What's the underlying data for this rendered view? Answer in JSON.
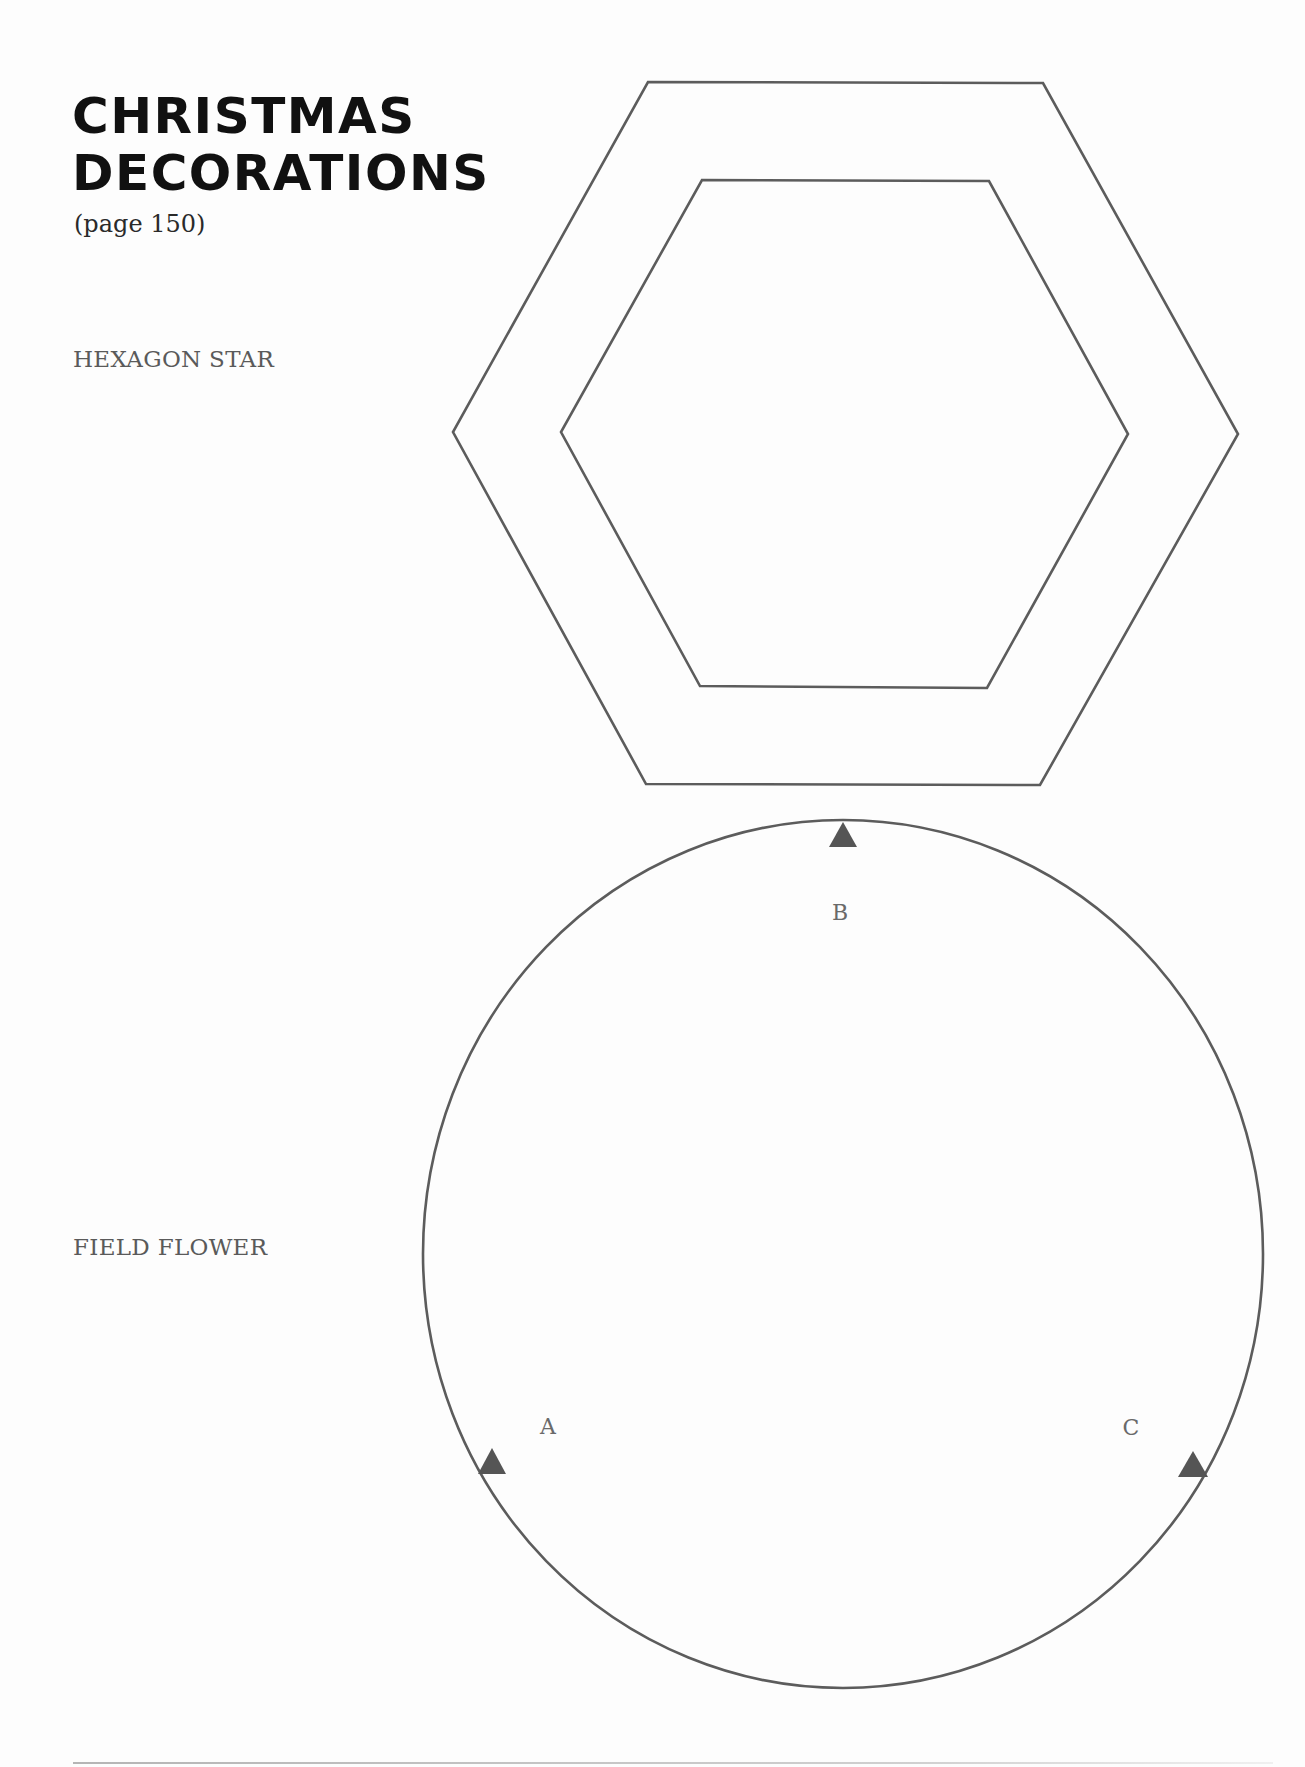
{
  "header": {
    "title_line1": "CHRISTMAS",
    "title_line2": "DECORATIONS",
    "page_ref": "(page 150)"
  },
  "sections": {
    "hexagon_star": {
      "label": "HEXAGON STAR"
    },
    "field_flower": {
      "label": "FIELD FLOWER",
      "markers": {
        "a": "A",
        "b": "B",
        "c": "C"
      }
    }
  },
  "colors": {
    "outline": "#5c5c5c",
    "marker": "#555555",
    "title": "#111111",
    "label": "#5a5a5a",
    "background": "#fdfdfd"
  }
}
